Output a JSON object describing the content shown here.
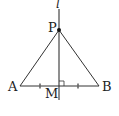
{
  "diagram": {
    "title": "",
    "line_label": "l",
    "points": {
      "P": {
        "label": "P",
        "x": 59,
        "y": 30
      },
      "A": {
        "label": "A",
        "x": 20,
        "y": 86
      },
      "B": {
        "label": "B",
        "x": 99,
        "y": 86
      },
      "M": {
        "label": "M",
        "x": 59,
        "y": 86
      }
    },
    "segments": [
      "PA",
      "PB",
      "AB"
    ],
    "line": {
      "name": "l",
      "through": [
        "P",
        "M"
      ],
      "perpendicular_to": "AB"
    },
    "marks": {
      "right_angle_at": "M",
      "equal_ticks": [
        "AM",
        "MB"
      ]
    },
    "colors": {
      "stroke": "#333333",
      "background": "#ffffff"
    }
  }
}
